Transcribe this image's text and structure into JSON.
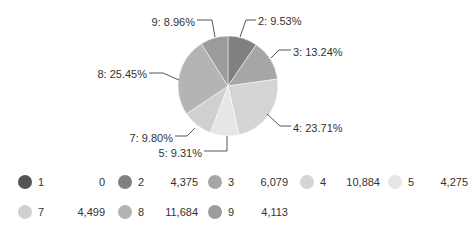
{
  "chart_data": {
    "type": "pie",
    "title": "",
    "start_angle_deg": 0,
    "direction": "clockwise",
    "slices": [
      {
        "name": "1",
        "value": 0,
        "percent": 0,
        "color": "#555555"
      },
      {
        "name": "2",
        "value": 4375,
        "percent": 9.53,
        "color": "#808080"
      },
      {
        "name": "3",
        "value": 6079,
        "percent": 13.24,
        "color": "#a6a6a6"
      },
      {
        "name": "4",
        "value": 10884,
        "percent": 23.71,
        "color": "#d4d4d4"
      },
      {
        "name": "5",
        "value": 4275,
        "percent": 9.31,
        "color": "#e6e6e6"
      },
      {
        "name": "7",
        "value": 4499,
        "percent": 9.8,
        "color": "#d0d0d0"
      },
      {
        "name": "8",
        "value": 11684,
        "percent": 25.45,
        "color": "#b4b4b4"
      },
      {
        "name": "9",
        "value": 4113,
        "percent": 8.96,
        "color": "#9c9c9c"
      }
    ],
    "labels": [
      {
        "text": "2: 9.53%",
        "x": 258,
        "y": 21,
        "anchor": "start"
      },
      {
        "text": "3: 13.24%",
        "x": 293,
        "y": 52,
        "anchor": "start"
      },
      {
        "text": "4: 23.71%",
        "x": 293,
        "y": 128,
        "anchor": "start"
      },
      {
        "text": "5: 9.31%",
        "x": 202,
        "y": 153,
        "anchor": "end"
      },
      {
        "text": "7: 9.80%",
        "x": 173,
        "y": 138,
        "anchor": "end"
      },
      {
        "text": "8: 25.45%",
        "x": 147,
        "y": 74,
        "anchor": "end"
      },
      {
        "text": "9: 8.96%",
        "x": 195,
        "y": 22,
        "anchor": "end"
      }
    ],
    "legend": {
      "position": "bottom",
      "rows": [
        [
          {
            "name": "1",
            "value": "0",
            "color": "#555555"
          },
          {
            "name": "2",
            "value": "4,375",
            "color": "#808080"
          },
          {
            "name": "3",
            "value": "6,079",
            "color": "#a6a6a6"
          },
          {
            "name": "4",
            "value": "10,884",
            "color": "#d4d4d4"
          },
          {
            "name": "5",
            "value": "4,275",
            "color": "#e6e6e6"
          }
        ],
        [
          {
            "name": "7",
            "value": "4,499",
            "color": "#d0d0d0"
          },
          {
            "name": "8",
            "value": "11,684",
            "color": "#b4b4b4"
          },
          {
            "name": "9",
            "value": "4,113",
            "color": "#9c9c9c"
          }
        ]
      ]
    }
  }
}
